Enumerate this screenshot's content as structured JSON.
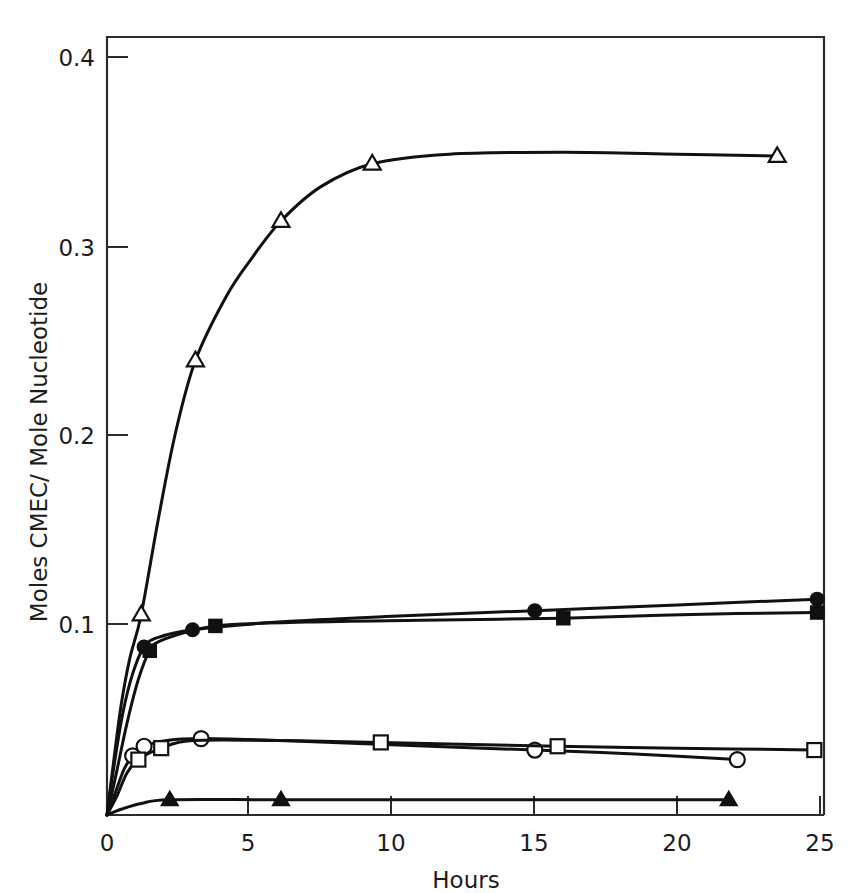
{
  "chart_data": {
    "type": "line",
    "title": "",
    "xlabel": "Hours",
    "ylabel": "Moles CMEC/ Mole Nucleotide",
    "xlim": [
      0,
      25
    ],
    "ylim": [
      0,
      0.42
    ],
    "xticks": [
      0,
      5,
      10,
      15,
      20,
      25
    ],
    "xtick_labels": [
      "0",
      "5",
      "10",
      "15",
      "20",
      "25"
    ],
    "yticks": [
      0.1,
      0.2,
      0.3,
      0.4
    ],
    "ytick_labels": [
      "0.1",
      "0.2",
      "0.3",
      "0.4"
    ],
    "grid": false,
    "legend": "none",
    "series": [
      {
        "name": "open-triangle",
        "marker": "triangle-open",
        "points": [
          {
            "x": 0.0,
            "y": 0.0
          },
          {
            "x": 0.25,
            "y": 0.03
          },
          {
            "x": 0.5,
            "y": 0.058
          },
          {
            "x": 0.8,
            "y": 0.082
          },
          {
            "x": 1.2,
            "y": 0.105
          },
          {
            "x": 1.8,
            "y": 0.155
          },
          {
            "x": 2.4,
            "y": 0.2
          },
          {
            "x": 3.1,
            "y": 0.238
          },
          {
            "x": 4.2,
            "y": 0.272
          },
          {
            "x": 5.1,
            "y": 0.292
          },
          {
            "x": 6.1,
            "y": 0.311
          },
          {
            "x": 7.5,
            "y": 0.329
          },
          {
            "x": 9.3,
            "y": 0.341
          },
          {
            "x": 12.0,
            "y": 0.346
          },
          {
            "x": 16.0,
            "y": 0.347
          },
          {
            "x": 20.0,
            "y": 0.346
          },
          {
            "x": 23.5,
            "y": 0.345
          }
        ],
        "marker_points": [
          {
            "x": 1.2,
            "y": 0.105
          },
          {
            "x": 3.1,
            "y": 0.238
          },
          {
            "x": 6.1,
            "y": 0.311
          },
          {
            "x": 9.3,
            "y": 0.341
          },
          {
            "x": 23.5,
            "y": 0.345
          }
        ]
      },
      {
        "name": "filled-circle",
        "marker": "circle-filled",
        "points": [
          {
            "x": 0.0,
            "y": 0.0
          },
          {
            "x": 0.25,
            "y": 0.026
          },
          {
            "x": 0.55,
            "y": 0.053
          },
          {
            "x": 0.9,
            "y": 0.074
          },
          {
            "x": 1.3,
            "y": 0.088
          },
          {
            "x": 1.8,
            "y": 0.093
          },
          {
            "x": 3.0,
            "y": 0.097
          },
          {
            "x": 6.0,
            "y": 0.101
          },
          {
            "x": 10.0,
            "y": 0.104
          },
          {
            "x": 15.0,
            "y": 0.107
          },
          {
            "x": 20.0,
            "y": 0.11
          },
          {
            "x": 24.9,
            "y": 0.113
          }
        ],
        "marker_points": [
          {
            "x": 1.3,
            "y": 0.088
          },
          {
            "x": 3.0,
            "y": 0.097
          },
          {
            "x": 15.0,
            "y": 0.107
          },
          {
            "x": 24.9,
            "y": 0.113
          }
        ]
      },
      {
        "name": "filled-square",
        "marker": "square-filled",
        "points": [
          {
            "x": 0.0,
            "y": 0.0
          },
          {
            "x": 0.3,
            "y": 0.02
          },
          {
            "x": 0.7,
            "y": 0.048
          },
          {
            "x": 1.1,
            "y": 0.071
          },
          {
            "x": 1.5,
            "y": 0.086
          },
          {
            "x": 2.0,
            "y": 0.092
          },
          {
            "x": 3.8,
            "y": 0.099
          },
          {
            "x": 7.0,
            "y": 0.101
          },
          {
            "x": 11.0,
            "y": 0.102
          },
          {
            "x": 16.0,
            "y": 0.103
          },
          {
            "x": 20.5,
            "y": 0.105
          },
          {
            "x": 24.9,
            "y": 0.106
          }
        ],
        "marker_points": [
          {
            "x": 1.5,
            "y": 0.086
          },
          {
            "x": 3.8,
            "y": 0.099
          },
          {
            "x": 16.0,
            "y": 0.103
          },
          {
            "x": 24.9,
            "y": 0.106
          }
        ]
      },
      {
        "name": "open-circle",
        "marker": "circle-open",
        "points": [
          {
            "x": 0.0,
            "y": 0.0
          },
          {
            "x": 0.3,
            "y": 0.012
          },
          {
            "x": 0.6,
            "y": 0.024
          },
          {
            "x": 0.9,
            "y": 0.031
          },
          {
            "x": 1.3,
            "y": 0.036
          },
          {
            "x": 2.1,
            "y": 0.039
          },
          {
            "x": 3.3,
            "y": 0.04
          },
          {
            "x": 6.0,
            "y": 0.039
          },
          {
            "x": 9.5,
            "y": 0.037
          },
          {
            "x": 15.0,
            "y": 0.034
          },
          {
            "x": 18.5,
            "y": 0.032
          },
          {
            "x": 22.1,
            "y": 0.029
          }
        ],
        "marker_points": [
          {
            "x": 0.9,
            "y": 0.031
          },
          {
            "x": 1.3,
            "y": 0.036
          },
          {
            "x": 3.3,
            "y": 0.04
          },
          {
            "x": 15.0,
            "y": 0.034
          },
          {
            "x": 22.1,
            "y": 0.029
          }
        ]
      },
      {
        "name": "open-square",
        "marker": "square-open",
        "points": [
          {
            "x": 0.0,
            "y": 0.0
          },
          {
            "x": 0.35,
            "y": 0.01
          },
          {
            "x": 0.7,
            "y": 0.022
          },
          {
            "x": 1.1,
            "y": 0.029
          },
          {
            "x": 1.9,
            "y": 0.035
          },
          {
            "x": 3.0,
            "y": 0.039
          },
          {
            "x": 6.0,
            "y": 0.039
          },
          {
            "x": 9.6,
            "y": 0.038
          },
          {
            "x": 15.8,
            "y": 0.036
          },
          {
            "x": 20.0,
            "y": 0.035
          },
          {
            "x": 24.8,
            "y": 0.034
          }
        ],
        "marker_points": [
          {
            "x": 1.1,
            "y": 0.029
          },
          {
            "x": 1.9,
            "y": 0.035
          },
          {
            "x": 9.6,
            "y": 0.038
          },
          {
            "x": 15.8,
            "y": 0.036
          },
          {
            "x": 24.8,
            "y": 0.034
          }
        ]
      },
      {
        "name": "filled-triangle",
        "marker": "triangle-filled",
        "points": [
          {
            "x": 0.0,
            "y": 0.0
          },
          {
            "x": 0.5,
            "y": 0.003
          },
          {
            "x": 1.2,
            "y": 0.006
          },
          {
            "x": 2.2,
            "y": 0.008
          },
          {
            "x": 6.1,
            "y": 0.008
          },
          {
            "x": 12.0,
            "y": 0.008
          },
          {
            "x": 17.0,
            "y": 0.008
          },
          {
            "x": 21.8,
            "y": 0.008
          }
        ],
        "marker_points": [
          {
            "x": 2.2,
            "y": 0.008
          },
          {
            "x": 6.1,
            "y": 0.008
          },
          {
            "x": 21.8,
            "y": 0.008
          }
        ]
      }
    ]
  },
  "axes": {
    "x_label": "Hours",
    "y_label": "Moles CMEC/ Mole Nucleotide",
    "x_tick_0": "0",
    "x_tick_1": "5",
    "x_tick_2": "10",
    "x_tick_3": "15",
    "x_tick_4": "20",
    "x_tick_5": "25",
    "y_tick_0": "0.1",
    "y_tick_1": "0.2",
    "y_tick_2": "0.3",
    "y_tick_3": "0.4"
  },
  "colors": {
    "line": "#111111",
    "frame": "#2b2b2b",
    "background": "#ffffff",
    "marker_fill_open": "#ffffff"
  }
}
